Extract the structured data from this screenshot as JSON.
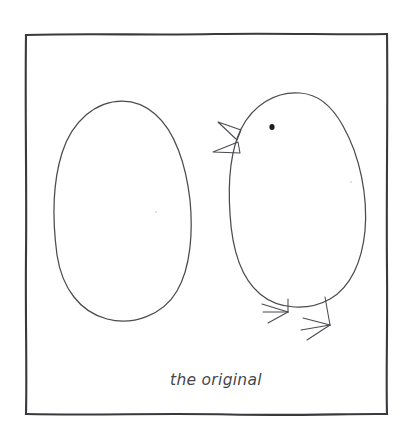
{
  "artwork": {
    "title_caption": "the original",
    "medium": "pencil sketch on white paper",
    "paper_color": "#ffffff",
    "ink_color": "#4a4a4f",
    "frame_color": "#3a3a3e",
    "eye_color": "#1d1d20"
  },
  "frame": {
    "name": "hand-drawn-square-border",
    "left": 26,
    "top": 34,
    "right": 387,
    "bottom": 414
  },
  "subjects": [
    {
      "name": "egg",
      "label": "egg",
      "side": "left",
      "center_x": 122,
      "center_y": 210,
      "width": 135,
      "height": 220
    },
    {
      "name": "chick",
      "label": "chick",
      "side": "right",
      "center_x": 297,
      "center_y": 200,
      "width": 140,
      "height": 215,
      "features": [
        "beak",
        "eye",
        "left-foot",
        "right-foot"
      ]
    }
  ],
  "caption": {
    "text": "the original",
    "x": 170,
    "baseline_y": 385
  }
}
